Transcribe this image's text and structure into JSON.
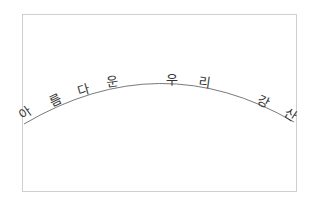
{
  "figure": {
    "text_on_path": "아름다운 우리 강산",
    "characters": [
      {
        "char": "아",
        "x": 25,
        "y": 113,
        "rotate": -36
      },
      {
        "char": "름",
        "x": 55,
        "y": 100,
        "rotate": -26
      },
      {
        "char": "다",
        "x": 84,
        "y": 90,
        "rotate": -16
      },
      {
        "char": "운",
        "x": 112,
        "y": 82,
        "rotate": -8
      },
      {
        "char": "우",
        "x": 172,
        "y": 79,
        "rotate": 0
      },
      {
        "char": "리",
        "x": 205,
        "y": 82,
        "rotate": 8
      },
      {
        "char": "강",
        "x": 263,
        "y": 102,
        "rotate": 26
      },
      {
        "char": "산",
        "x": 290,
        "y": 115,
        "rotate": 34
      }
    ],
    "frame": {
      "x": 22,
      "y": 14,
      "width": 274,
      "height": 177,
      "color": "#cfcfcf"
    },
    "arc": {
      "path": "M 24 124 Q 160 44 294 122",
      "color": "#7a7a7a"
    }
  }
}
